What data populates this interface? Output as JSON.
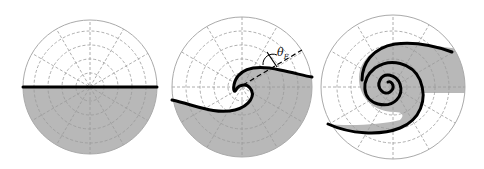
{
  "figure": {
    "panels": [
      {
        "id": "flat",
        "description": "Flat interface, lower half filled"
      },
      {
        "id": "rollup",
        "description": "Interface rolling up into a wave"
      },
      {
        "id": "spiral",
        "description": "Fully developed spiral interface"
      }
    ],
    "angle_label": {
      "symbol": "θ",
      "subscript": "F"
    },
    "colors": {
      "fill": "#b8b8b8",
      "interface": "#000000",
      "grid": "#9a9a9a"
    }
  }
}
